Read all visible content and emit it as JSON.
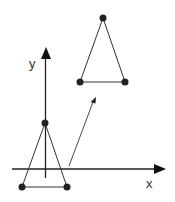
{
  "diagram": {
    "colors": {
      "stroke": "#333333",
      "axis": "#222222",
      "vertex": "#222222",
      "background": "#ffffff"
    },
    "axes": {
      "x_label": "x",
      "y_label": "y"
    },
    "original_triangle": {
      "apex": [
        45,
        123
      ],
      "base_left": [
        22,
        187
      ],
      "base_right": [
        67,
        187
      ]
    },
    "translated_triangle": {
      "apex": [
        103,
        18
      ],
      "base_left": [
        80,
        82
      ],
      "base_right": [
        125,
        82
      ]
    },
    "translation_arrow": {
      "from": [
        69,
        166
      ],
      "to": [
        95,
        98
      ]
    }
  }
}
